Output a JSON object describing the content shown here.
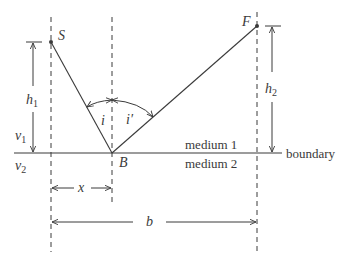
{
  "diagram": {
    "points": {
      "source": {
        "label": "S",
        "x": 51,
        "y": 42
      },
      "finish": {
        "label": "F",
        "x": 257,
        "y": 26
      },
      "bounce": {
        "label": "B",
        "x": 112,
        "y": 153
      }
    },
    "angles": {
      "incidence": "i",
      "reflection": "i′"
    },
    "heights": {
      "h1": {
        "label": "h",
        "sub": "1"
      },
      "h2": {
        "label": "h",
        "sub": "2"
      }
    },
    "velocities": {
      "v1": {
        "label": "v",
        "sub": "1"
      },
      "v2": {
        "label": "v",
        "sub": "2"
      }
    },
    "media": {
      "upper": "medium 1",
      "lower": "medium 2",
      "boundary": "boundary"
    },
    "distances": {
      "x": "x",
      "b": "b"
    },
    "colors": {
      "line": "#3a3a3a",
      "dash": "#3a3a3a"
    }
  }
}
